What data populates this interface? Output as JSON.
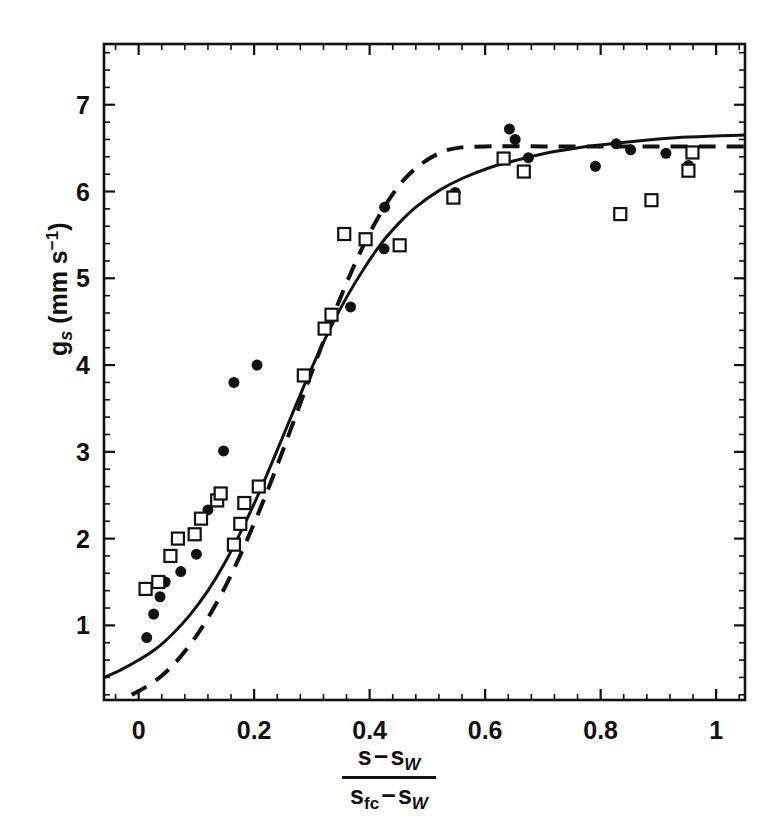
{
  "figure": {
    "background": "#ffffff",
    "ink": "#111111"
  },
  "axes": {
    "x": {
      "label_parts": {
        "numerator_lead": "s",
        "numerator_minus": "−",
        "numerator_term": "s",
        "numerator_sub": "W",
        "denominator_lead": "s",
        "denominator_lead_sub": "fc",
        "denominator_minus": "−",
        "denominator_term": "s",
        "denominator_sub": "W"
      },
      "tick_labels": [
        "0",
        "0.2",
        "0.4",
        "0.6",
        "0.8",
        "1"
      ],
      "tick_values": [
        0,
        0.2,
        0.4,
        0.6,
        0.8,
        1.0
      ],
      "minor_ticks_per_interval": 4,
      "range": [
        -0.06,
        1.05
      ]
    },
    "y": {
      "label_main": "g",
      "label_sub": "s",
      "label_unit": " (mm s",
      "label_unit_sup": "−1",
      "label_unit_close": ")",
      "tick_labels": [
        "1",
        "2",
        "3",
        "4",
        "5",
        "6",
        "7"
      ],
      "tick_values": [
        1,
        2,
        3,
        4,
        5,
        6,
        7
      ],
      "minor_ticks_per_interval": 4,
      "range": [
        0.14,
        7.7
      ]
    },
    "frame": {
      "left": 104,
      "right": 745,
      "top": 44,
      "bottom": 700
    },
    "grid": false,
    "legend": "none"
  },
  "chart_data": {
    "type": "scatter",
    "title": "",
    "xlabel": "(s - s_W) / (s_fc - s_W)",
    "ylabel": "g_s (mm s^-1)",
    "xlim": [
      -0.06,
      1.05
    ],
    "ylim": [
      0.14,
      7.7
    ],
    "grid": false,
    "legend_position": "none",
    "series": [
      {
        "name": "filled-circles",
        "marker": "filled-circle",
        "marker_size": 11,
        "color": "#111111",
        "points": [
          [
            0.014,
            0.86
          ],
          [
            0.026,
            1.13
          ],
          [
            0.037,
            1.33
          ],
          [
            0.046,
            1.5
          ],
          [
            0.073,
            1.62
          ],
          [
            0.1,
            1.82
          ],
          [
            0.12,
            2.33
          ],
          [
            0.147,
            3.01
          ],
          [
            0.165,
            3.8
          ],
          [
            0.205,
            4.0
          ],
          [
            0.367,
            4.67
          ],
          [
            0.425,
            5.34
          ],
          [
            0.426,
            5.82
          ],
          [
            0.548,
            5.99
          ],
          [
            0.642,
            6.72
          ],
          [
            0.652,
            6.6
          ],
          [
            0.675,
            6.39
          ],
          [
            0.791,
            6.29
          ],
          [
            0.827,
            6.55
          ],
          [
            0.852,
            6.48
          ],
          [
            0.913,
            6.44
          ],
          [
            0.952,
            6.3
          ]
        ]
      },
      {
        "name": "open-squares",
        "marker": "open-square",
        "marker_size": 12,
        "color": "#111111",
        "points": [
          [
            0.012,
            1.42
          ],
          [
            0.034,
            1.5
          ],
          [
            0.055,
            1.8
          ],
          [
            0.068,
            2.0
          ],
          [
            0.097,
            2.05
          ],
          [
            0.108,
            2.23
          ],
          [
            0.136,
            2.44
          ],
          [
            0.142,
            2.52
          ],
          [
            0.165,
            1.93
          ],
          [
            0.176,
            2.17
          ],
          [
            0.183,
            2.41
          ],
          [
            0.208,
            2.6
          ],
          [
            0.286,
            3.88
          ],
          [
            0.322,
            4.42
          ],
          [
            0.334,
            4.58
          ],
          [
            0.356,
            5.51
          ],
          [
            0.393,
            5.45
          ],
          [
            0.452,
            5.38
          ],
          [
            0.545,
            5.93
          ],
          [
            0.632,
            6.38
          ],
          [
            0.667,
            6.23
          ],
          [
            0.834,
            5.74
          ],
          [
            0.888,
            5.9
          ],
          [
            0.952,
            6.24
          ],
          [
            0.959,
            6.45
          ]
        ]
      }
    ],
    "curves": [
      {
        "name": "solid-model-curve",
        "style": "solid",
        "linewidth": 3,
        "color": "#111111",
        "points": [
          [
            -0.06,
            0.4
          ],
          [
            -0.03,
            0.49
          ],
          [
            0.0,
            0.6
          ],
          [
            0.03,
            0.73
          ],
          [
            0.06,
            0.91
          ],
          [
            0.09,
            1.13
          ],
          [
            0.12,
            1.4
          ],
          [
            0.15,
            1.73
          ],
          [
            0.18,
            2.12
          ],
          [
            0.21,
            2.55
          ],
          [
            0.24,
            3.02
          ],
          [
            0.27,
            3.5
          ],
          [
            0.3,
            3.97
          ],
          [
            0.33,
            4.4
          ],
          [
            0.36,
            4.78
          ],
          [
            0.39,
            5.11
          ],
          [
            0.42,
            5.4
          ],
          [
            0.45,
            5.63
          ],
          [
            0.48,
            5.82
          ],
          [
            0.52,
            6.01
          ],
          [
            0.56,
            6.15
          ],
          [
            0.61,
            6.28
          ],
          [
            0.66,
            6.37
          ],
          [
            0.72,
            6.46
          ],
          [
            0.79,
            6.53
          ],
          [
            0.86,
            6.58
          ],
          [
            0.93,
            6.62
          ],
          [
            1.0,
            6.64
          ],
          [
            1.05,
            6.65
          ]
        ]
      },
      {
        "name": "dashed-model-curve",
        "style": "dashed",
        "linewidth": 4,
        "dash_pattern": "17 11",
        "color": "#111111",
        "points": [
          [
            -0.012,
            0.2
          ],
          [
            0.01,
            0.28
          ],
          [
            0.04,
            0.42
          ],
          [
            0.07,
            0.62
          ],
          [
            0.1,
            0.88
          ],
          [
            0.13,
            1.2
          ],
          [
            0.16,
            1.58
          ],
          [
            0.19,
            2.02
          ],
          [
            0.22,
            2.5
          ],
          [
            0.25,
            3.02
          ],
          [
            0.28,
            3.56
          ],
          [
            0.31,
            4.1
          ],
          [
            0.34,
            4.62
          ],
          [
            0.37,
            5.1
          ],
          [
            0.4,
            5.52
          ],
          [
            0.43,
            5.87
          ],
          [
            0.46,
            6.14
          ],
          [
            0.49,
            6.32
          ],
          [
            0.52,
            6.44
          ],
          [
            0.55,
            6.5
          ],
          [
            0.6,
            6.52
          ],
          [
            0.7,
            6.52
          ],
          [
            0.8,
            6.52
          ],
          [
            0.9,
            6.52
          ],
          [
            1.0,
            6.52
          ],
          [
            1.05,
            6.52
          ]
        ]
      }
    ]
  }
}
